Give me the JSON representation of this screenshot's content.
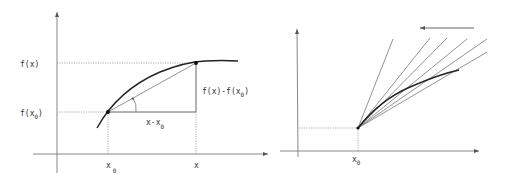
{
  "left_panel": {
    "y_labels": {
      "fx": "f(x)",
      "fx0_main": "f(x",
      "fx0_sub": "0",
      "fx0_close": ")"
    },
    "x_labels": {
      "x0_main": "x",
      "x0_sub": "0",
      "x": "x"
    },
    "delta_x": {
      "main": "x-x",
      "sub": "0"
    },
    "delta_y": {
      "main": "f(x)-f(x",
      "sub": "0",
      "close": ")"
    }
  },
  "right_panel": {
    "x_labels": {
      "x0_main": "x",
      "x0_sub": "0"
    },
    "arrow_direction": "left",
    "secant_count": 6
  },
  "colors": {
    "axis": "#888888",
    "curve": "#222222",
    "secant": "#777777",
    "guide": "#999999"
  }
}
